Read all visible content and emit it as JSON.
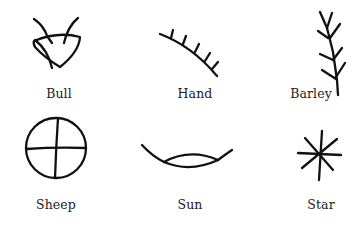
{
  "figure": {
    "pictographs": [
      {
        "id": "bull",
        "label": "Bull",
        "icon": "bull-head-pictograph",
        "row": 1,
        "col": 1
      },
      {
        "id": "hand",
        "label": "Hand",
        "icon": "hand-pictograph",
        "row": 1,
        "col": 2
      },
      {
        "id": "barley",
        "label": "Barley",
        "icon": "barley-pictograph",
        "row": 1,
        "col": 3
      },
      {
        "id": "sheep",
        "label": "Sheep",
        "icon": "sheep-pictograph",
        "row": 2,
        "col": 1
      },
      {
        "id": "sun",
        "label": "Sun",
        "icon": "sun-pictograph",
        "row": 2,
        "col": 2
      },
      {
        "id": "star",
        "label": "Star",
        "icon": "star-pictograph",
        "row": 2,
        "col": 3
      }
    ]
  }
}
